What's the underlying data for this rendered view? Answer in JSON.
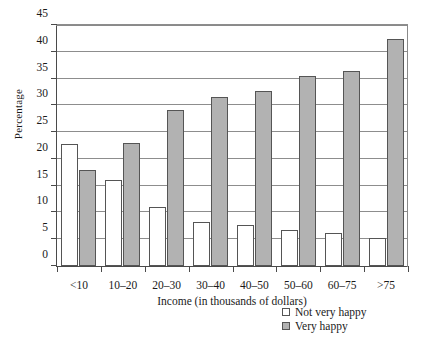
{
  "chart_data": {
    "type": "bar",
    "title": "",
    "xlabel": "Income (in thousands of dollars)",
    "ylabel": "Percentage",
    "categories": [
      "<10",
      "10–20",
      "20–30",
      "30–40",
      "40–50",
      "50–60",
      "60–75",
      ">75"
    ],
    "series": [
      {
        "name": "Not very happy",
        "color": "#ffffff",
        "values": [
          22.7,
          16.1,
          11.1,
          8.3,
          7.7,
          6.8,
          6.1,
          5.3
        ]
      },
      {
        "name": "Very happy",
        "color": "#b2b2b2",
        "values": [
          17.9,
          22.9,
          29.1,
          31.5,
          32.6,
          35.5,
          36.4,
          42.4
        ]
      }
    ],
    "ylim": [
      0,
      45
    ],
    "yticks": [
      0,
      5,
      10,
      15,
      20,
      25,
      30,
      35,
      40,
      45
    ],
    "ytick_labels": [
      "0",
      "5",
      "10",
      "15",
      "20",
      "25",
      "30",
      "35",
      "40",
      "45"
    ],
    "grid": true,
    "grid_axis": "y",
    "legend_position": "below-right"
  },
  "legend": {
    "items": [
      {
        "label": "Not very happy",
        "swatch": "hollow"
      },
      {
        "label": "Very happy",
        "swatch": "gray"
      }
    ]
  },
  "colors": {
    "bar_not_very_happy": "#ffffff",
    "bar_very_happy": "#b2b2b2",
    "bar_outline": "#555555",
    "gridline": "#8d8d8d",
    "axis": "#4a4a4a",
    "background": "#ffffff",
    "text": "#1a1a1a"
  }
}
